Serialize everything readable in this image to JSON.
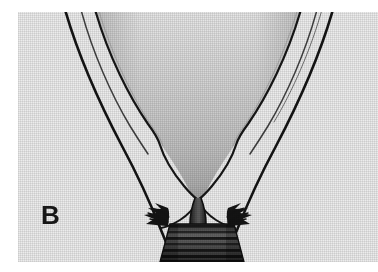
{
  "figure": {
    "panel_label": "B",
    "caption": "",
    "alt_description": "Halftone-printed anatomical line drawing: a broad V-shaped shaded mass tapering to a narrow central stem, flanked by paired outline curves, with serrated margins and a horizontally banded trapezoid at the base."
  },
  "canvas": {
    "width": 378,
    "height": 272,
    "page_background": "#ffffff"
  },
  "plate": {
    "left": 18,
    "top": 12,
    "width": 360,
    "height": 250,
    "background": "#ececec",
    "texture": "halftone-dot-screen"
  },
  "palette": {
    "paper_white": "#ffffff",
    "plate_gray": "#ececec",
    "mass_light": "#e2e2e2",
    "mass_mid": "#c9c9c9",
    "mass_dark": "#b4b4b4",
    "ink_black": "#141414",
    "ink_soft": "#3a3a3a",
    "band_dark": "#2b2b2b",
    "label_color": "#171717"
  },
  "elements": {
    "central_mass": {
      "name": "shaded-v-mass",
      "description": "Large funnel / V-shaped shaded body occupying the upper center, graded from near-white at the top to mid gray at the tapering apex."
    },
    "left_outer_curve": {
      "name": "left-outer-outline",
      "description": "Long dark curve sweeping from upper-left down toward lower-center."
    },
    "right_outer_curve": {
      "name": "right-outer-outline",
      "description": "Mirror curve sweeping from upper-right down toward lower-center."
    },
    "left_inner_curve": {
      "name": "left-inner-outline",
      "description": "Thin companion line just inside the left outer curve."
    },
    "right_inner_curve": {
      "name": "right-inner-outline",
      "description": "Thin companion line just inside the right outer curve."
    },
    "central_stem": {
      "name": "central-stem",
      "description": "Narrow dark column where the shaded mass constricts before meeting the banded base."
    },
    "left_serration": {
      "name": "left-serrated-margin",
      "description": "Sawtooth comb-like spikes along the left shoulder of the base."
    },
    "right_serration": {
      "name": "right-serrated-margin",
      "description": "Mirrored sawtooth spikes along the right shoulder of the base."
    },
    "banded_base": {
      "name": "banded-base",
      "description": "Trapezoidal block at the bottom center crossed by horizontal dark striations."
    }
  }
}
